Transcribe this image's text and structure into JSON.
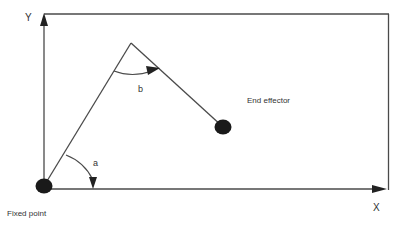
{
  "diagram": {
    "type": "two-link robot arm kinematics",
    "labels": {
      "y_axis": "Y",
      "x_axis": "X",
      "fixed_point": "Fixed point",
      "end_effector": "End effector",
      "angle_a": "a",
      "angle_b": "b"
    },
    "colors": {
      "line": "#4a4a4a",
      "joint": "#1a1a1a",
      "text": "#333333",
      "background": "#ffffff"
    }
  }
}
